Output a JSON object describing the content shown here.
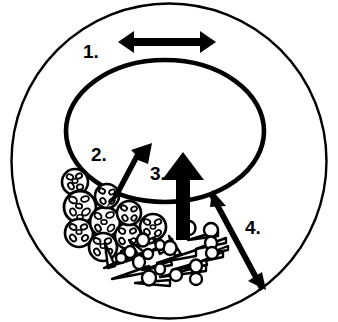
{
  "figure": {
    "background_color": "#ffffff",
    "stroke_color": "#000000"
  },
  "structures": {
    "outer_boundary": {
      "name": "outer-circle",
      "shape": "circle",
      "cx": 169,
      "cy": 161,
      "r": 158,
      "stroke_width": 2.4,
      "fill": "none"
    },
    "inner_boundary": {
      "name": "inner-lumen-ellipse",
      "shape": "ellipse",
      "cx": 165,
      "cy": 131,
      "rx": 99,
      "ry": 71,
      "stroke_width": 4.5,
      "fill": "none"
    }
  },
  "labels": [
    {
      "id": "label-1",
      "text": "1.",
      "x": 83,
      "y": 58
    },
    {
      "id": "label-2",
      "text": "2.",
      "x": 91,
      "y": 161
    },
    {
      "id": "label-3",
      "text": "3.",
      "x": 150,
      "y": 180
    },
    {
      "id": "label-4",
      "text": "4.",
      "x": 245,
      "y": 234
    }
  ],
  "arrows": [
    {
      "id": "arrow-1",
      "label": "1.",
      "style": "double-headed-bold-horizontal",
      "x1": 118,
      "y1": 42,
      "x2": 216,
      "y2": 42,
      "shaft_width": 7,
      "head_size": 14,
      "description": "bidirectional arrow across the wall region"
    },
    {
      "id": "arrow-2",
      "label": "2.",
      "style": "single-headed-bold-diagonal",
      "x1": 113,
      "y1": 203,
      "x2": 148,
      "y2": 148,
      "shaft_width": 11,
      "head_size": 22,
      "description": "arrow pointing up-right from granular cell cluster into lumen"
    },
    {
      "id": "arrow-3",
      "label": "3.",
      "style": "single-headed-bold-vertical",
      "x1": 183,
      "y1": 238,
      "x2": 183,
      "y2": 157,
      "shaft_width": 12,
      "head_size": 25,
      "description": "arrow pointing straight up from rod-shaped bacteria into lumen"
    },
    {
      "id": "arrow-4",
      "label": "4.",
      "style": "double-headed-thin-diagonal",
      "x1": 214,
      "y1": 193,
      "x2": 262,
      "y2": 285,
      "shaft_width": 4,
      "head_size": 13,
      "description": "thin bidirectional arrow from lumen edge outward to the outer boundary"
    }
  ],
  "cell_clusters": [
    {
      "id": "granular-cells",
      "name": "granular-cell-cluster",
      "type": "round-cells-with-internal-granules",
      "count": 9,
      "cells": [
        {
          "cx": 75,
          "cy": 182,
          "r": 13
        },
        {
          "cx": 80,
          "cy": 206,
          "r": 16
        },
        {
          "cx": 79,
          "cy": 232,
          "r": 14
        },
        {
          "cx": 104,
          "cy": 222,
          "r": 15
        },
        {
          "cx": 103,
          "cy": 247,
          "r": 14
        },
        {
          "cx": 127,
          "cy": 236,
          "r": 13
        },
        {
          "cx": 129,
          "cy": 213,
          "r": 12
        },
        {
          "cx": 152,
          "cy": 227,
          "r": 13
        },
        {
          "cx": 107,
          "cy": 196,
          "r": 12
        }
      ]
    },
    {
      "id": "rod-bacteria",
      "name": "rod-shaped-bacteria-field",
      "type": "tapered-rods-and-ovals",
      "rod_count": 18,
      "oval_count": 16
    }
  ]
}
